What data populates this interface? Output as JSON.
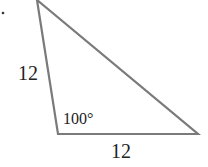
{
  "diagram": {
    "type": "triangle",
    "vertices": {
      "top": [
        37,
        0
      ],
      "bottom_left": [
        58,
        134
      ],
      "bottom_right": [
        198,
        134
      ]
    },
    "labels": {
      "left_side": "12",
      "bottom_side": "12",
      "angle_bottom_left": "100°"
    },
    "colors": {
      "stroke": "#7a7a7a",
      "text": "#222222"
    }
  }
}
